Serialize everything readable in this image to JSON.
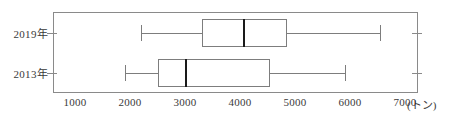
{
  "chart_data": {
    "type": "box",
    "title": "",
    "xlabel": "",
    "ylabel": "",
    "unit_label": "(トン)",
    "xlim": [
      500,
      7230
    ],
    "xticks": [
      1000,
      2000,
      3000,
      4000,
      5000,
      6000,
      7000
    ],
    "xtick_labels": [
      "1000",
      "2000",
      "3000",
      "4000",
      "5000",
      "6000",
      "7000"
    ],
    "grid": true,
    "grid_orientation": "vertical",
    "legend": "none",
    "categories": [
      "2019年",
      "2013年"
    ],
    "boxes": [
      {
        "category": "2019年",
        "min": 2200,
        "q1": 3300,
        "median": 4050,
        "q3": 4850,
        "max": 6550
      },
      {
        "category": "2013年",
        "min": 1900,
        "q1": 2500,
        "median": 3000,
        "q3": 4550,
        "max": 5900
      }
    ]
  },
  "axis": {
    "x_ticks": [
      {
        "value": "1000"
      },
      {
        "value": "2000"
      },
      {
        "value": "3000"
      },
      {
        "value": "4000"
      },
      {
        "value": "5000"
      },
      {
        "value": "6000"
      },
      {
        "value": "7000"
      }
    ],
    "unit": "(トン)",
    "y_categories": [
      {
        "label": "2019年"
      },
      {
        "label": "2013年"
      }
    ]
  },
  "colors": {
    "frame": "#8a8a8a",
    "gridline": "#b9b9b9",
    "box_stroke": "#7d7d7d",
    "median_stroke": "#1a1a1a",
    "text": "#3a3a3a",
    "background": "#ffffff"
  }
}
